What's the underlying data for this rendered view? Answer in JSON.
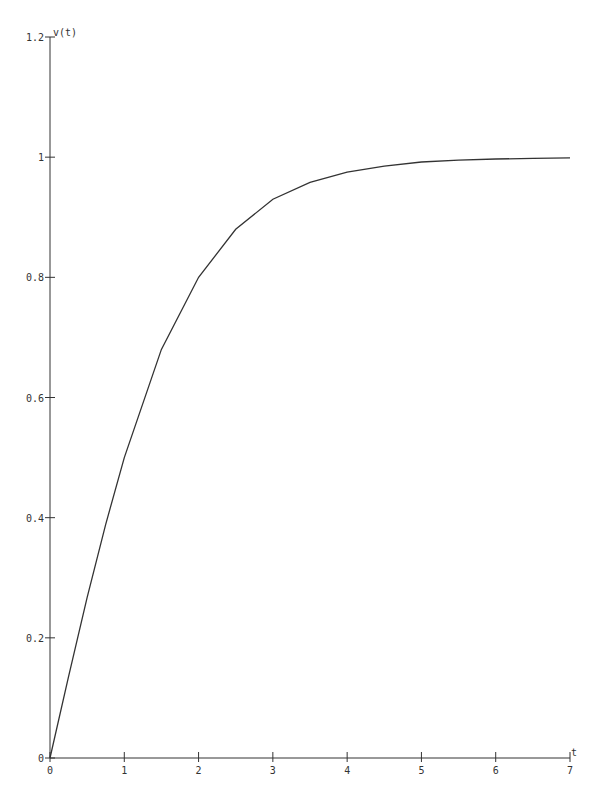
{
  "chart_data": {
    "type": "line",
    "title": "",
    "xlabel": "t",
    "ylabel": "v(t)",
    "xlim": [
      0,
      7
    ],
    "ylim": [
      0,
      1.2
    ],
    "grid": false,
    "legend": null,
    "x_ticks": [
      "0",
      "1",
      "2",
      "3",
      "4",
      "5",
      "6",
      "7"
    ],
    "y_ticks": [
      "0",
      "0.2",
      "0.4",
      "0.6",
      "0.8",
      "1",
      "1.2"
    ],
    "series": [
      {
        "name": "v(t)",
        "x": [
          0,
          0.25,
          0.5,
          0.75,
          1,
          1.5,
          2,
          2.5,
          3,
          3.5,
          4,
          4.5,
          5,
          5.5,
          6,
          6.5,
          7
        ],
        "values": [
          0,
          0.136,
          0.267,
          0.389,
          0.5,
          0.68,
          0.8,
          0.88,
          0.93,
          0.958,
          0.975,
          0.985,
          0.992,
          0.995,
          0.997,
          0.998,
          0.999
        ]
      }
    ]
  }
}
